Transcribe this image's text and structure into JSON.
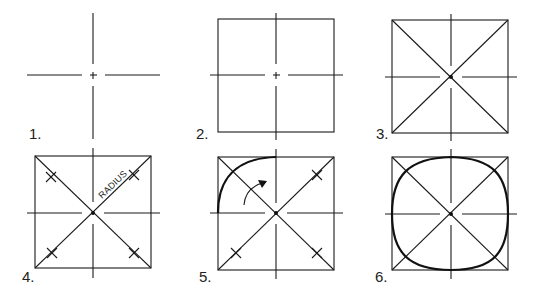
{
  "stroke_color": "#1a1a1a",
  "background": "#ffffff",
  "steps": [
    {
      "label": "1.",
      "description": "Draw perpendicular centerlines"
    },
    {
      "label": "2.",
      "description": "Draw square around centerlines"
    },
    {
      "label": "3.",
      "description": "Draw diagonals of the square"
    },
    {
      "label": "4.",
      "description": "Mark radius on diagonals",
      "annotation": "RADIUS"
    },
    {
      "label": "5.",
      "description": "Sketch arc through marks"
    },
    {
      "label": "6.",
      "description": "Complete the circle"
    }
  ]
}
